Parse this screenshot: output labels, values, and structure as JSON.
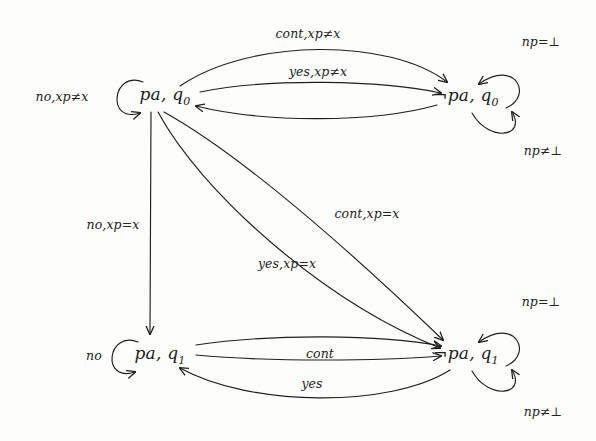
{
  "diagram": {
    "type": "state-transition-diagram",
    "background_color": "#fdfdfb",
    "ink_color": "#1f1f1f",
    "states": [
      {
        "id": "pa_q0",
        "label": "pa, q",
        "sub": "0",
        "x": 165,
        "y": 96,
        "name": "state-pa-q0"
      },
      {
        "id": "npa_q0",
        "label": "¬pa, q",
        "sub": "0",
        "x": 466,
        "y": 97,
        "name": "state-not-pa-q0"
      },
      {
        "id": "pa_q1",
        "label": "pa, q",
        "sub": "1",
        "x": 160,
        "y": 355,
        "name": "state-pa-q1"
      },
      {
        "id": "npa_q1",
        "label": "¬pa, q",
        "sub": "1",
        "x": 466,
        "y": 355,
        "name": "state-not-pa-q1"
      }
    ],
    "self_loops": [
      {
        "id": "loop_pa_q0",
        "state": "pa_q0",
        "label": "no,xp≠x",
        "label_x": 62,
        "label_y": 96,
        "side": "left"
      },
      {
        "id": "loop_npa_q0_t",
        "state": "npa_q0",
        "label": "np=⊥",
        "label_x": 541,
        "label_y": 41,
        "side": "top-right"
      },
      {
        "id": "loop_npa_q0_b",
        "state": "npa_q0",
        "label": "np≠⊥",
        "label_x": 543,
        "label_y": 150,
        "side": "bottom-right"
      },
      {
        "id": "loop_pa_q1",
        "state": "pa_q1",
        "label": "no",
        "label_x": 94,
        "label_y": 355,
        "side": "left"
      },
      {
        "id": "loop_npa_q1_t",
        "state": "npa_q1",
        "label": "np=⊥",
        "label_x": 541,
        "label_y": 301,
        "side": "top-right"
      },
      {
        "id": "loop_npa_q1_b",
        "state": "npa_q1",
        "label": "np≠⊥",
        "label_x": 543,
        "label_y": 411,
        "side": "bottom-right"
      }
    ],
    "transitions": [
      {
        "id": "t_cont_neq",
        "from": "pa_q0",
        "to": "npa_q1",
        "label": "cont,xp≠x",
        "label_x": 308,
        "label_y": 33,
        "kind": "top-outer-arc"
      },
      {
        "id": "t_yes_neq",
        "from": "pa_q0",
        "to": "npa_q0",
        "label": "yes,xp≠x",
        "label_x": 318,
        "label_y": 71,
        "kind": "top-inner-arc"
      },
      {
        "id": "t_return_q0",
        "from": "npa_q0",
        "to": "pa_q0",
        "label": "",
        "label_x": 0,
        "label_y": 0,
        "kind": "top-return-arc"
      },
      {
        "id": "t_no_eq",
        "from": "pa_q0",
        "to": "pa_q1",
        "label": "no,xp=x",
        "label_x": 113,
        "label_y": 224,
        "kind": "vertical"
      },
      {
        "id": "t_cont_eq",
        "from": "pa_q0",
        "to": "npa_q1",
        "label": "cont,xp=x",
        "label_x": 367,
        "label_y": 213,
        "kind": "diagonal-upper"
      },
      {
        "id": "t_yes_eq",
        "from": "pa_q0",
        "to": "npa_q1",
        "label": "yes,xp=x",
        "label_x": 287,
        "label_y": 263,
        "kind": "diagonal-lower"
      },
      {
        "id": "t_cont_q1",
        "from": "pa_q1",
        "to": "npa_q1",
        "label": "cont",
        "label_x": 320,
        "label_y": 353,
        "kind": "bottom-upper-arc"
      },
      {
        "id": "t_plain_q1",
        "from": "pa_q1",
        "to": "npa_q1",
        "label": "",
        "label_x": 0,
        "label_y": 0,
        "kind": "bottom-mid-arc"
      },
      {
        "id": "t_yes_q1",
        "from": "npa_q1",
        "to": "pa_q1",
        "label": "yes",
        "label_x": 312,
        "label_y": 383,
        "kind": "bottom-return-arc"
      }
    ]
  }
}
